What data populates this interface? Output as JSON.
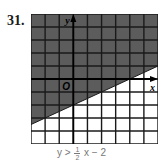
{
  "problem": {
    "number": "31.",
    "inequality_prefix": "y >",
    "fraction_numerator": "1",
    "fraction_denominator": "2",
    "inequality_suffix": "x − 2"
  },
  "graph": {
    "origin_label": "O",
    "x_axis_label": "x",
    "y_axis_label": "y",
    "shade_color": "#5c5c5c",
    "grid_color": "#1a1a1a",
    "background_color": "#ffffff"
  },
  "chart_data": {
    "type": "area",
    "xlabel": "x",
    "ylabel": "y",
    "xlim": [
      -3,
      6
    ],
    "ylim": [
      -5,
      5
    ],
    "grid": true,
    "boundary": {
      "slope": 0.5,
      "intercept": -2,
      "style": "solid"
    },
    "shaded_region": "above",
    "x": [
      -3,
      6
    ],
    "series": [
      {
        "name": "y = 1/2 x − 2",
        "values": [
          -3.5,
          1
        ]
      }
    ]
  }
}
